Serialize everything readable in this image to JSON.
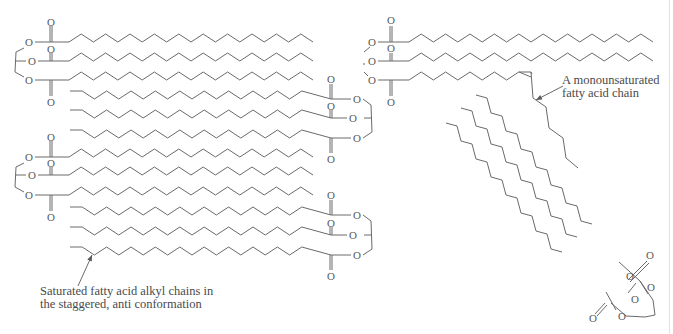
{
  "figure": {
    "colors": {
      "bond": "#6a6a6a",
      "text": "#4a4a4a",
      "background": "#ffffff"
    },
    "atom_symbol": "O"
  },
  "labels": {
    "saturated": {
      "line1": "Saturated fatty acid alkyl chains in",
      "line2": "the staggered, anti conformation"
    },
    "monounsaturated": {
      "line1": "A monounsaturated",
      "line2": "fatty acid chain"
    }
  },
  "molecules": {
    "packed_stack": [
      {
        "id": "tg1",
        "head_side": "left",
        "chain_y": [
          42,
          61,
          80
        ]
      },
      {
        "id": "tg2",
        "head_side": "right",
        "chain_y": [
          99,
          118,
          138
        ]
      },
      {
        "id": "tg3",
        "head_side": "left",
        "chain_y": [
          157,
          175,
          195
        ]
      },
      {
        "id": "tg4",
        "head_side": "right",
        "chain_y": [
          215,
          235,
          255
        ]
      }
    ],
    "unsaturated_tg": {
      "id": "tg5",
      "head_side": "left",
      "chain_y": [
        42,
        61,
        80
      ],
      "cis_double_bond": true
    },
    "diagonal_tg": {
      "id": "tg6",
      "orientation": "diagonal",
      "chain_count": 3
    }
  },
  "arrows": [
    {
      "name": "saturated-label-arrow",
      "from": [
        78,
        286
      ],
      "to": [
        92,
        255
      ]
    },
    {
      "name": "monounsaturated-label-arrow",
      "from": [
        563,
        86
      ],
      "to": [
        536,
        100
      ]
    }
  ]
}
